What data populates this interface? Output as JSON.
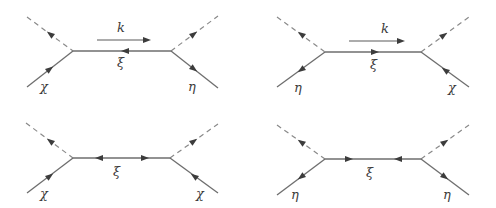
{
  "colors": {
    "line": "#6e6e6e",
    "dashed": "#8a8a8a",
    "arrow": "#3c3c3c",
    "label": "#3a3a3a",
    "background": "#ffffff"
  },
  "diagrams": [
    {
      "id": "top-left",
      "propagator_label": "ξ",
      "momentum_label": "k",
      "incoming_left": "χ",
      "outgoing_right": "η"
    },
    {
      "id": "top-right",
      "propagator_label": "ξ",
      "momentum_label": "k",
      "incoming_left": "η",
      "outgoing_right": "χ"
    },
    {
      "id": "bottom-left",
      "propagator_label": "ξ",
      "incoming_left": "χ",
      "outgoing_right": "χ"
    },
    {
      "id": "bottom-right",
      "propagator_label": "ξ",
      "incoming_left": "η",
      "outgoing_right": "η"
    }
  ]
}
